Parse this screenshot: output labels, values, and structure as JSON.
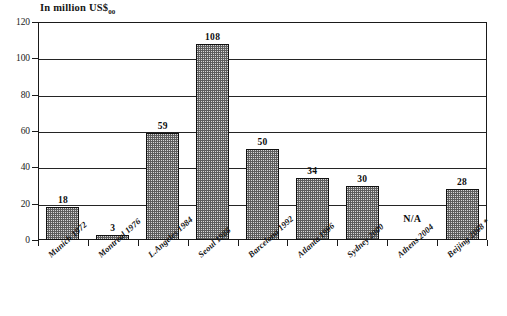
{
  "chart_data": {
    "type": "bar",
    "title": "",
    "ylabel": "In million US$",
    "ylabel_subscript": "00",
    "xlabel": "",
    "ylim": [
      0,
      120
    ],
    "yticks": [
      0,
      20,
      40,
      60,
      80,
      100,
      120
    ],
    "ytick_labels": [
      "0",
      "20",
      "40",
      "60",
      "80",
      "100",
      "120"
    ],
    "grid": true,
    "grid_axis": "y",
    "legend": false,
    "categories": [
      "Munich 1972",
      "Montreal 1976",
      "L.Angeles 1984",
      "Seoul 1988",
      "Barcelona 1992",
      "Atlanta 1996",
      "Sydney 2000",
      "Athens 2004",
      "Beijing 2008 *"
    ],
    "values": [
      18,
      3,
      59,
      108,
      50,
      34,
      30,
      null,
      28
    ],
    "value_labels": [
      "18",
      "3",
      "59",
      "108",
      "50",
      "34",
      "30",
      "N/A",
      "28"
    ],
    "missing_label": "N/A",
    "bar_color": "#d8d8d8",
    "bar_edge_color": "#111111",
    "bar_hatch": "dotted-checker",
    "axis_color": "#1a1a1a"
  }
}
